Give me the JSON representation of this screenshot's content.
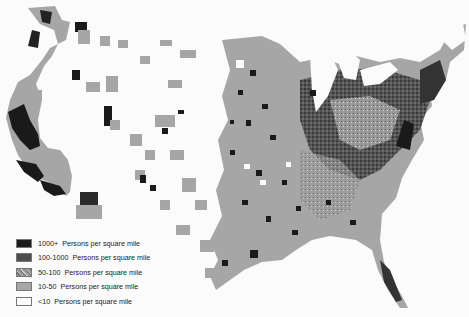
{
  "map": {
    "title": "",
    "subject": "United States population density by county",
    "background": "#fbfbfb",
    "legend": {
      "items": [
        {
          "range": "1000+",
          "label": "Persons per square mile",
          "color": "#1a1a1a",
          "pattern": "solid"
        },
        {
          "range": "100-1000",
          "label": "Persons per square mile",
          "color": "#4d4d4d",
          "pattern": "mottled"
        },
        {
          "range": "50-100",
          "label": "Persons per square mile",
          "color": "#8a8a8a",
          "pattern": "speckled"
        },
        {
          "range": "10-50",
          "label": "Persons per square mile",
          "color": "#a6a6a6",
          "pattern": "solid"
        },
        {
          "range": "<10",
          "label": "Persons per square mile",
          "color": "#fbfbfb",
          "pattern": "empty"
        }
      ]
    }
  }
}
